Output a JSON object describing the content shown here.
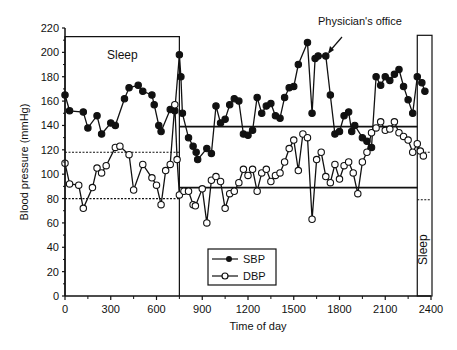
{
  "chart_data": {
    "type": "line",
    "title": "",
    "xlabel": "Time of day",
    "ylabel": "Blood pressure (mmHg)",
    "xlim": [
      0,
      2400
    ],
    "ylim": [
      0,
      220
    ],
    "x_ticks": [
      0,
      300,
      600,
      900,
      1200,
      1500,
      1800,
      2100,
      2400
    ],
    "y_ticks": [
      0,
      20,
      40,
      60,
      80,
      100,
      120,
      140,
      160,
      180,
      200,
      220
    ],
    "grid": false,
    "legend_position": "lower center",
    "annotations": [
      {
        "text": "Sleep",
        "x_range": [
          0,
          750
        ],
        "orientation": "horizontal"
      },
      {
        "text": "Sleep",
        "x_range": [
          2310,
          2400
        ],
        "orientation": "vertical"
      },
      {
        "text": "Physician's office",
        "arrow_to": [
          1700,
          197
        ]
      }
    ],
    "reference_lines": [
      {
        "label": "sleep SBP threshold",
        "y": 118,
        "x_range": [
          0,
          750
        ],
        "style": "dotted"
      },
      {
        "label": "sleep DBP threshold",
        "y": 80,
        "x_range": [
          0,
          750
        ],
        "style": "dotted"
      },
      {
        "label": "awake SBP threshold",
        "y": 139,
        "x_range": [
          750,
          2310
        ],
        "style": "solid"
      },
      {
        "label": "awake DBP threshold",
        "y": 89,
        "x_range": [
          750,
          2310
        ],
        "style": "solid"
      },
      {
        "label": "late sleep SBP",
        "y": 118,
        "x_range": [
          2310,
          2400
        ],
        "style": "dotted"
      },
      {
        "label": "late sleep DBP",
        "y": 79,
        "x_range": [
          2310,
          2400
        ],
        "style": "dotted"
      }
    ],
    "series": [
      {
        "name": "SBP",
        "marker": "filled-circle",
        "points": [
          [
            0,
            165
          ],
          [
            30,
            152
          ],
          [
            120,
            151
          ],
          [
            150,
            138
          ],
          [
            210,
            148
          ],
          [
            240,
            133
          ],
          [
            300,
            142
          ],
          [
            330,
            140
          ],
          [
            390,
            162
          ],
          [
            420,
            171
          ],
          [
            480,
            173
          ],
          [
            510,
            168
          ],
          [
            570,
            165
          ],
          [
            585,
            157
          ],
          [
            615,
            140
          ],
          [
            630,
            135
          ],
          [
            690,
            153
          ],
          [
            720,
            152
          ],
          [
            750,
            198
          ],
          [
            760,
            180
          ],
          [
            770,
            150
          ],
          [
            810,
            130
          ],
          [
            840,
            123
          ],
          [
            860,
            118
          ],
          [
            870,
            112
          ],
          [
            930,
            121
          ],
          [
            960,
            117
          ],
          [
            990,
            156
          ],
          [
            1020,
            142
          ],
          [
            1050,
            145
          ],
          [
            1080,
            157
          ],
          [
            1110,
            162
          ],
          [
            1140,
            160
          ],
          [
            1170,
            133
          ],
          [
            1200,
            132
          ],
          [
            1230,
            136
          ],
          [
            1260,
            163
          ],
          [
            1290,
            150
          ],
          [
            1320,
            156
          ],
          [
            1350,
            158
          ],
          [
            1380,
            148
          ],
          [
            1410,
            146
          ],
          [
            1440,
            163
          ],
          [
            1470,
            171
          ],
          [
            1500,
            172
          ],
          [
            1530,
            190
          ],
          [
            1590,
            208
          ],
          [
            1620,
            150
          ],
          [
            1640,
            195
          ],
          [
            1660,
            197
          ],
          [
            1710,
            197
          ],
          [
            1740,
            165
          ],
          [
            1770,
            133
          ],
          [
            1800,
            135
          ],
          [
            1830,
            148
          ],
          [
            1860,
            151
          ],
          [
            1880,
            135
          ],
          [
            1900,
            140
          ],
          [
            1950,
            130
          ],
          [
            1980,
            127
          ],
          [
            2010,
            122
          ],
          [
            2040,
            180
          ],
          [
            2070,
            173
          ],
          [
            2100,
            180
          ],
          [
            2130,
            177
          ],
          [
            2160,
            182
          ],
          [
            2190,
            186
          ],
          [
            2220,
            172
          ],
          [
            2250,
            161
          ],
          [
            2280,
            150
          ],
          [
            2310,
            180
          ],
          [
            2340,
            175
          ],
          [
            2360,
            168
          ]
        ]
      },
      {
        "name": "DBP",
        "marker": "open-circle",
        "points": [
          [
            0,
            109
          ],
          [
            30,
            92
          ],
          [
            90,
            91
          ],
          [
            120,
            72
          ],
          [
            180,
            89
          ],
          [
            210,
            105
          ],
          [
            240,
            101
          ],
          [
            270,
            107
          ],
          [
            330,
            122
          ],
          [
            360,
            123
          ],
          [
            420,
            116
          ],
          [
            450,
            87
          ],
          [
            510,
            108
          ],
          [
            570,
            97
          ],
          [
            600,
            91
          ],
          [
            630,
            75
          ],
          [
            660,
            103
          ],
          [
            690,
            108
          ],
          [
            720,
            157
          ],
          [
            735,
            112
          ],
          [
            750,
            83
          ],
          [
            780,
            86
          ],
          [
            810,
            86
          ],
          [
            840,
            75
          ],
          [
            855,
            74
          ],
          [
            900,
            88
          ],
          [
            930,
            60
          ],
          [
            960,
            95
          ],
          [
            990,
            98
          ],
          [
            1020,
            94
          ],
          [
            1050,
            72
          ],
          [
            1080,
            84
          ],
          [
            1110,
            86
          ],
          [
            1140,
            93
          ],
          [
            1170,
            104
          ],
          [
            1200,
            99
          ],
          [
            1230,
            104
          ],
          [
            1260,
            86
          ],
          [
            1290,
            101
          ],
          [
            1320,
            104
          ],
          [
            1350,
            94
          ],
          [
            1380,
            99
          ],
          [
            1410,
            101
          ],
          [
            1440,
            110
          ],
          [
            1470,
            121
          ],
          [
            1500,
            128
          ],
          [
            1530,
            103
          ],
          [
            1560,
            133
          ],
          [
            1590,
            130
          ],
          [
            1620,
            63
          ],
          [
            1650,
            112
          ],
          [
            1680,
            118
          ],
          [
            1710,
            98
          ],
          [
            1740,
            93
          ],
          [
            1770,
            108
          ],
          [
            1800,
            96
          ],
          [
            1830,
            107
          ],
          [
            1860,
            110
          ],
          [
            1890,
            101
          ],
          [
            1920,
            84
          ],
          [
            1950,
            110
          ],
          [
            1980,
            118
          ],
          [
            2010,
            134
          ],
          [
            2040,
            138
          ],
          [
            2070,
            143
          ],
          [
            2100,
            136
          ],
          [
            2130,
            137
          ],
          [
            2160,
            143
          ],
          [
            2190,
            134
          ],
          [
            2220,
            131
          ],
          [
            2250,
            128
          ],
          [
            2280,
            118
          ],
          [
            2310,
            125
          ],
          [
            2330,
            119
          ],
          [
            2350,
            115
          ]
        ]
      }
    ],
    "legend": [
      {
        "label": "SBP",
        "marker": "filled-circle"
      },
      {
        "label": "DBP",
        "marker": "open-circle"
      }
    ]
  },
  "labels": {
    "xlabel": "Time of day",
    "ylabel": "Blood pressure (mmHg)",
    "sleep_top": "Sleep",
    "sleep_side": "Sleep",
    "physician": "Physician's office",
    "legend_sbp": "SBP",
    "legend_dbp": "DBP"
  }
}
